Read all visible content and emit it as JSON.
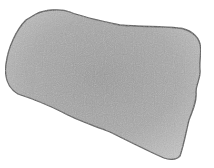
{
  "image": {
    "width": 214,
    "height": 168,
    "background": "#ffffff",
    "subject": "irregular gray textured fragment",
    "fill_color": "#a8a8a8",
    "fill_light": "#c8c8c8",
    "fill_dark": "#8e8e8e",
    "outline_color": "#555555"
  }
}
